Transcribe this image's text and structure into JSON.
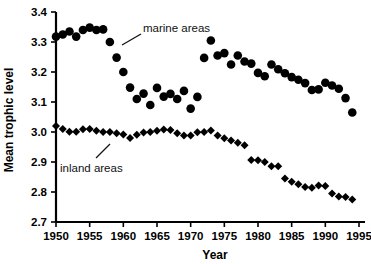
{
  "chart_data": {
    "type": "scatter",
    "title": "",
    "xlabel": "Year",
    "ylabel": "Mean trophic level",
    "xlim": [
      1950,
      1995
    ],
    "ylim": [
      2.7,
      3.4
    ],
    "xticks": [
      1950,
      1955,
      1960,
      1965,
      1970,
      1975,
      1980,
      1985,
      1990,
      1995
    ],
    "yticks": [
      "3.4",
      "3.3",
      "3.2",
      "3.1",
      "3.0",
      "2.9",
      "2.8",
      "2.7"
    ],
    "grid": false,
    "legend_position": "inline-annotations",
    "annotations": [
      {
        "text": "marine areas",
        "points_to_series": "marine areas"
      },
      {
        "text": "inland areas",
        "points_to_series": "inland areas"
      }
    ],
    "series": [
      {
        "name": "marine areas",
        "marker": "circle",
        "color": "#000000",
        "x": [
          1950,
          1951,
          1952,
          1953,
          1954,
          1955,
          1956,
          1957,
          1958,
          1959,
          1960,
          1961,
          1962,
          1963,
          1964,
          1965,
          1966,
          1967,
          1968,
          1969,
          1970,
          1971,
          1972,
          1973,
          1974,
          1975,
          1976,
          1977,
          1978,
          1979,
          1980,
          1981,
          1982,
          1983,
          1984,
          1985,
          1986,
          1987,
          1988,
          1989,
          1990,
          1991,
          1992,
          1993,
          1994
        ],
        "y": [
          3.318,
          3.325,
          3.335,
          3.318,
          3.34,
          3.348,
          3.34,
          3.342,
          3.3,
          3.248,
          3.2,
          3.148,
          3.11,
          3.128,
          3.09,
          3.147,
          3.118,
          3.127,
          3.11,
          3.137,
          3.078,
          3.117,
          3.247,
          3.305,
          3.255,
          3.263,
          3.225,
          3.255,
          3.235,
          3.228,
          3.197,
          3.186,
          3.225,
          3.209,
          3.196,
          3.183,
          3.174,
          3.163,
          3.14,
          3.142,
          3.164,
          3.155,
          3.144,
          3.113,
          3.065
        ]
      },
      {
        "name": "inland areas",
        "marker": "diamond",
        "color": "#000000",
        "x": [
          1950,
          1951,
          1952,
          1953,
          1954,
          1955,
          1956,
          1957,
          1958,
          1959,
          1960,
          1961,
          1962,
          1963,
          1964,
          1965,
          1966,
          1967,
          1968,
          1969,
          1970,
          1971,
          1972,
          1973,
          1974,
          1975,
          1976,
          1977,
          1978,
          1979,
          1980,
          1981,
          1982,
          1983,
          1984,
          1985,
          1986,
          1987,
          1988,
          1989,
          1990,
          1991,
          1992,
          1993,
          1994
        ],
        "y": [
          3.02,
          3.01,
          3.001,
          3.001,
          3.009,
          3.01,
          3.004,
          3.0,
          3.0,
          2.996,
          2.992,
          2.98,
          2.991,
          2.998,
          3.0,
          3.004,
          3.008,
          3.007,
          2.996,
          2.988,
          2.988,
          2.999,
          3.0,
          3.005,
          2.988,
          2.979,
          2.972,
          2.964,
          2.956,
          2.907,
          2.906,
          2.9,
          2.886,
          2.886,
          2.845,
          2.834,
          2.826,
          2.817,
          2.814,
          2.822,
          2.82,
          2.795,
          2.785,
          2.783,
          2.775
        ]
      }
    ]
  }
}
